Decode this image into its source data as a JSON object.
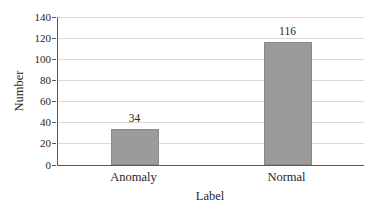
{
  "figure": {
    "background": "#ffffff"
  },
  "chart_data": {
    "type": "bar",
    "title": "",
    "categories": [
      "Anomaly",
      "Normal"
    ],
    "values": [
      34,
      116
    ],
    "data_labels": [
      "34",
      "116"
    ],
    "xlabel": "Label",
    "ylabel": "Number",
    "ylim": [
      0,
      140
    ],
    "yticks": [
      0,
      20,
      40,
      60,
      80,
      100,
      120,
      140
    ],
    "ytick_labels": [
      "0",
      "20",
      "40",
      "60",
      "80",
      "100",
      "120",
      "140"
    ],
    "grid": "horizontal",
    "legend": "none",
    "colors": {
      "bar_fill": "#9b9b9b",
      "bar_border": "#8a8a8a",
      "axis_line": "#595959",
      "gridline": "#d9d9d9",
      "text": "#262626"
    }
  }
}
